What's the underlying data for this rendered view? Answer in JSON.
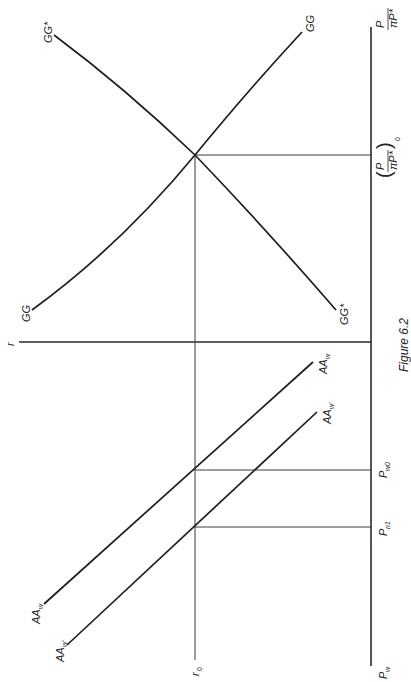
{
  "figure": {
    "caption": "Figure 6.2",
    "orientation": "rotated 90° (landscape figure printed in portrait)"
  },
  "upper_panel": {
    "vertical_axis_label": "r",
    "horizontal_axis_label_num": "P",
    "horizontal_axis_label_den": "πP*",
    "equilibrium_label_num": "P",
    "equilibrium_label_den": "πP*",
    "equilibrium_label_sub": "0",
    "curves": [
      {
        "name": "GG",
        "label_top": "GG",
        "label_bottom": "GG"
      },
      {
        "name": "GG*",
        "label_top": "GG*",
        "label_bottom": "GG*"
      }
    ]
  },
  "lower_panel": {
    "vertical_axis_label": "r",
    "horizontal_axis_label": "P",
    "horizontal_axis_label_sub": "w",
    "r0_label": "r",
    "r0_sub": "0",
    "ticks": [
      {
        "label": "P",
        "sub": "w0"
      },
      {
        "label": "P",
        "sub": "n1"
      }
    ],
    "curves": [
      {
        "name": "AA_w",
        "label": "AA",
        "sub": "w"
      },
      {
        "name": "AA_w'",
        "label": "AA",
        "sub": "w'"
      }
    ]
  },
  "labels": {
    "gg_top": "GG",
    "gg_bottom": "GG",
    "ggs_top": "GG*",
    "ggs_bottom": "GG*",
    "r_axis": "r",
    "p_num": "P",
    "p_den": "πP*",
    "p0_num": "P",
    "p0_den": "πP*",
    "p0_sub": "0",
    "aaw_top": "AA",
    "aaw_top_sub": "w",
    "aaw_bottom": "AA",
    "aaw_bottom_sub": "w",
    "aawp_top": "AA",
    "aawp_top_sub": "w'",
    "aawp_bottom": "AA",
    "aawp_bottom_sub": "w'",
    "r0": "r",
    "r0_sub": "0",
    "pw0": "P",
    "pw0_sub": "w0",
    "pn1": "P",
    "pn1_sub": "n1",
    "pw": "P",
    "pw_sub": "w",
    "caption": "Figure 6.2"
  }
}
